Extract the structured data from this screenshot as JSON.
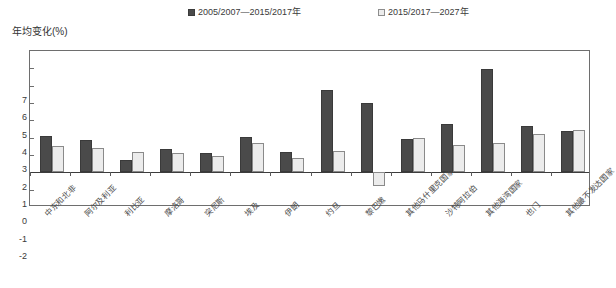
{
  "chart_data": {
    "type": "bar",
    "title": "",
    "xlabel": "",
    "ylabel": "年均变化(%)",
    "ylim": [
      -2,
      7
    ],
    "yticks": [
      7,
      6,
      5,
      4,
      3,
      2,
      1,
      0,
      -1,
      -2
    ],
    "ytick_labels": [
      "7",
      "6",
      "5",
      "4",
      "3",
      "2",
      "1",
      "0",
      "-1",
      "-2"
    ],
    "grid": false,
    "legend_position": "top",
    "categories": [
      "中东和北非",
      "阿尔及利亚",
      "利比亚",
      "摩洛哥",
      "突尼斯",
      "埃及",
      "伊朗",
      "约旦",
      "黎巴嫩",
      "其他马什里克国家",
      "沙特阿拉伯",
      "其他海湾国家",
      "也门",
      "其他最不发达国家"
    ],
    "series": [
      {
        "name": "2005/2007—2015/2017年",
        "color": "#4a4a4a",
        "values": [
          2.1,
          1.85,
          0.7,
          1.35,
          1.1,
          2.05,
          1.2,
          4.75,
          4.0,
          1.9,
          2.8,
          5.95,
          2.7,
          2.4
        ]
      },
      {
        "name": "2015/2017—2027年",
        "color": "#ececec",
        "values": [
          1.5,
          1.4,
          1.15,
          1.1,
          0.95,
          1.7,
          0.8,
          1.25,
          -0.8,
          2.0,
          1.55,
          1.7,
          2.2,
          2.45
        ]
      }
    ]
  },
  "legend": {
    "items": [
      {
        "label": "2005/2007—2015/2017年",
        "swatch": "dark-square-swatch"
      },
      {
        "label": "2015/2017—2027年",
        "swatch": "light-square-swatch"
      }
    ]
  },
  "axis": {
    "y_title": "年均变化(%)"
  }
}
